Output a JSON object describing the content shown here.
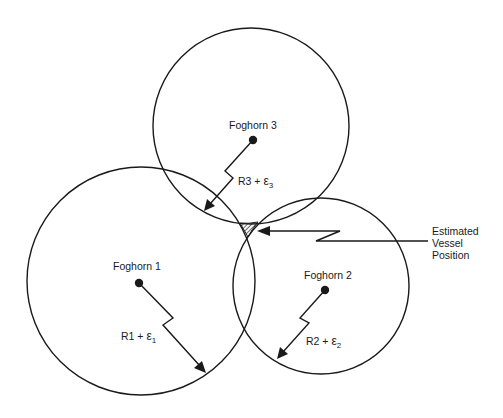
{
  "diagram": {
    "type": "trilateration",
    "foghorns": [
      {
        "label": "Foghorn 1",
        "range_label": "R1 + ",
        "epsilon": "ε",
        "subscript": "1"
      },
      {
        "label": "Foghorn 2",
        "range_label": "R2 + ",
        "epsilon": "ε",
        "subscript": "2"
      },
      {
        "label": "Foghorn 3",
        "range_label": "R3 + ",
        "epsilon": "ε",
        "subscript": "3"
      }
    ],
    "callout": {
      "lines": [
        "Estimated",
        "Vessel",
        "Position"
      ]
    }
  },
  "colors": {
    "stroke": "#1a1a1a",
    "background": "#ffffff"
  }
}
